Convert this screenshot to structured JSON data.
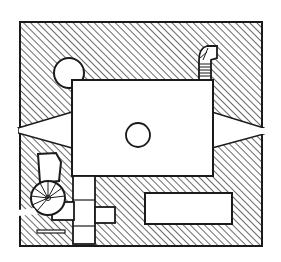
{
  "diagram": {
    "type": "architectural-floor-plan",
    "style": "hand-drawn ink, hatched walls",
    "colors": {
      "ink": "#1a1a1a",
      "background": "#ffffff"
    },
    "elements": [
      {
        "id": "outer-walls",
        "kind": "hatched-wall-mass"
      },
      {
        "id": "main-hall",
        "kind": "rectangular-room",
        "feature": "central circular column"
      },
      {
        "id": "round-tower-nw",
        "kind": "circular-niche"
      },
      {
        "id": "stair-ne",
        "kind": "small-spiral-stair"
      },
      {
        "id": "loophole-west",
        "kind": "splayed-embrasure"
      },
      {
        "id": "loophole-east",
        "kind": "splayed-embrasure"
      },
      {
        "id": "spiral-stair-sw",
        "kind": "spiral-staircase"
      },
      {
        "id": "chamber-sw",
        "kind": "small-room"
      },
      {
        "id": "passage-south",
        "kind": "corridor"
      },
      {
        "id": "chamber-se",
        "kind": "long-rectangular-room"
      },
      {
        "id": "slit-sw",
        "kind": "narrow-slot"
      }
    ]
  }
}
